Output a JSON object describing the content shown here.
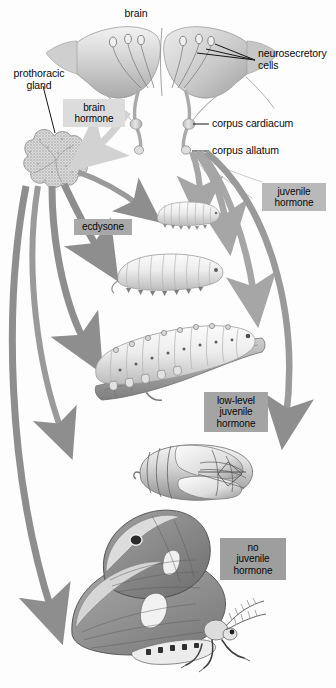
{
  "figure": {
    "type": "diagram",
    "background_color": "#fdfdfd",
    "arrow_color": "#9a9a9a",
    "leader_line_color": "#161616"
  },
  "labels": [
    {
      "id": "brain",
      "text": "brain",
      "x": 136,
      "y": 8,
      "align": "center"
    },
    {
      "id": "neurosecretory-cells",
      "text": "neurosecretory\ncells",
      "x": 258,
      "y": 48,
      "align": "left"
    },
    {
      "id": "prothoracic-gland",
      "text": "prothoracic\ngland",
      "x": 4,
      "y": 68,
      "align": "center"
    },
    {
      "id": "corpus-cardiacum",
      "text": "corpus cardiacum",
      "x": 212,
      "y": 117,
      "align": "left"
    },
    {
      "id": "corpus-allatum",
      "text": "corpus allatum",
      "x": 212,
      "y": 145,
      "align": "left"
    }
  ],
  "hormone_boxes": [
    {
      "id": "brain-hormone",
      "text": "brain\nhormone",
      "x": 63,
      "y": 99,
      "w": 62,
      "h": 28,
      "bg": "#dcdcdc",
      "fg": "#080808"
    },
    {
      "id": "ecdysone",
      "text": "ecdysone",
      "x": 74,
      "y": 219,
      "w": 58,
      "h": 16,
      "bg": "#a8a8a8",
      "fg": "#080808"
    },
    {
      "id": "juvenile-hormone",
      "text": "juvenile\nhormone",
      "x": 262,
      "y": 183,
      "w": 64,
      "h": 28,
      "bg": "#b9b9b9",
      "fg": "#080808"
    },
    {
      "id": "low-level-juvenile-hormone",
      "text": "low-level\njuvenile\nhormone",
      "x": 204,
      "y": 392,
      "w": 64,
      "h": 40,
      "bg": "#a4a4a4",
      "fg": "#080808"
    },
    {
      "id": "no-juvenile-hormone",
      "text": "no\njuvenile\nhormone",
      "x": 220,
      "y": 538,
      "w": 66,
      "h": 42,
      "bg": "#9e9e9e",
      "fg": "#080808"
    }
  ],
  "stages": [
    {
      "id": "brain-with-glands",
      "name": "brain with neurosecretory cells, corpus cardiacum and corpus allatum",
      "cx": 160,
      "cy": 78
    },
    {
      "id": "prothoracic-gland-art",
      "name": "prothoracic gland",
      "cx": 52,
      "cy": 165
    },
    {
      "id": "larva-instar-1",
      "name": "first instar larva",
      "cx": 186,
      "cy": 213
    },
    {
      "id": "larva-instar-2",
      "name": "second instar larva",
      "cx": 178,
      "cy": 271
    },
    {
      "id": "larva-instar-3",
      "name": "mature larva on twig",
      "cx": 176,
      "cy": 352
    },
    {
      "id": "pupa",
      "name": "pupa",
      "cx": 196,
      "cy": 474
    },
    {
      "id": "adult-moth",
      "name": "adult moth",
      "cx": 162,
      "cy": 600
    }
  ],
  "arrows": [
    {
      "id": "brain-hormone-arrow",
      "from": "brain",
      "to": "prothoracic-gland-art",
      "color": "#d2d2d2"
    },
    {
      "id": "ecdysone-to-larva1",
      "from": "prothoracic-gland",
      "to": "larva-instar-1",
      "color": "#9a9a9a"
    },
    {
      "id": "ecdysone-to-larva2",
      "from": "prothoracic-gland",
      "to": "larva-instar-2",
      "color": "#8e8e8e"
    },
    {
      "id": "ecdysone-to-larva3",
      "from": "prothoracic-gland",
      "to": "larva-instar-3",
      "color": "#8e8e8e"
    },
    {
      "id": "ecdysone-to-pupa",
      "from": "prothoracic-gland",
      "to": "pupa",
      "color": "#9a9a9a"
    },
    {
      "id": "ecdysone-to-adult",
      "from": "prothoracic-gland",
      "to": "adult-moth",
      "color": "#8e8e8e"
    },
    {
      "id": "jh-to-larva1",
      "from": "corpus-allatum",
      "to": "larva-instar-1",
      "color": "#a6a6a6"
    },
    {
      "id": "jh-to-larva2",
      "from": "corpus-allatum",
      "to": "larva-instar-2",
      "color": "#a6a6a6"
    },
    {
      "id": "jh-to-larva3",
      "from": "corpus-allatum",
      "to": "larva-instar-3",
      "color": "#a6a6a6"
    },
    {
      "id": "jh-low-to-pupa",
      "from": "corpus-allatum",
      "to": "pupa",
      "color": "#9a9a9a"
    }
  ]
}
